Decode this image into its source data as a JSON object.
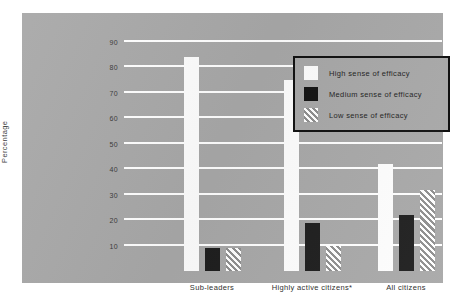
{
  "chart_data": {
    "type": "bar",
    "title": "",
    "xlabel": "",
    "ylabel": "Percentage",
    "ylim": [
      0,
      90
    ],
    "yticks": [
      90,
      80,
      70,
      60,
      50,
      40,
      30,
      20,
      10
    ],
    "grid": true,
    "legend_position": "top-right",
    "categories": [
      "Sub-leaders",
      "Highly active citizens*",
      "All citizens"
    ],
    "series": [
      {
        "name": "High sense of efficacy",
        "values": [
          84,
          75,
          42
        ]
      },
      {
        "name": "Medium sense of efficacy",
        "values": [
          9,
          19,
          22
        ]
      },
      {
        "name": "Low sense of efficacy",
        "values": [
          9,
          10,
          32
        ]
      }
    ]
  },
  "legend": {
    "items": [
      {
        "label": "High sense of efficacy",
        "swatch": "solid-white-swatch"
      },
      {
        "label": "Medium sense of efficacy",
        "swatch": "solid-black-swatch"
      },
      {
        "label": "Low sense of efficacy",
        "swatch": "diagonal-hatch-swatch"
      }
    ]
  },
  "axis": {
    "y_title": "Percentage",
    "y_tick_labels": [
      "90",
      "80",
      "70",
      "60",
      "50",
      "40",
      "30",
      "20",
      "10"
    ],
    "x_tick_labels": [
      "Sub-leaders",
      "Highly active citizens*",
      "All citizens"
    ]
  },
  "colors": {
    "panel_background": "#a8a8a8",
    "page_background": "#ffffff",
    "gridline": "#ffffff",
    "high_series": "#fdfdfd",
    "medium_series": "#1e1e1e",
    "low_series_hatch": "#8f8f8f",
    "text": "#303030",
    "legend_border": "#111111"
  }
}
